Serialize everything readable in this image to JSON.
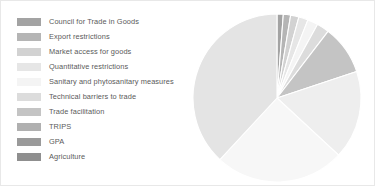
{
  "canvas": {
    "width": 375,
    "height": 186,
    "background": "#ffffff",
    "border_color": "#e8e8e8"
  },
  "legend": {
    "position": "left",
    "text_color": "#5a5a5a",
    "items": [
      {
        "label": "Council for Trade in Goods",
        "color": "#a3a3a3"
      },
      {
        "label": "Export restrictions",
        "color": "#b5b5b5"
      },
      {
        "label": "Market access for goods",
        "color": "#d2d2d2"
      },
      {
        "label": "Quantitative restrictions",
        "color": "#e6e6e6"
      },
      {
        "label": "Sanitary and phytosanitary measures",
        "color": "#f4f4f4"
      },
      {
        "label": "Technical barriers to trade",
        "color": "#dcdcdc"
      },
      {
        "label": "Trade facilitation",
        "color": "#c4c4c4"
      },
      {
        "label": "TRIPS",
        "color": "#b0b0b0"
      },
      {
        "label": "GPA",
        "color": "#9a9a9a"
      },
      {
        "label": "Agriculture",
        "color": "#8f8f8f"
      }
    ]
  },
  "chart_data": {
    "type": "pie",
    "title": "",
    "xlabel": "",
    "ylabel": "",
    "legend_position": "left",
    "grid": false,
    "start_angle_deg": 0,
    "direction": "clockwise",
    "center": {
      "cx": 86,
      "cy": 91
    },
    "radius": 84,
    "slice_separator_color": "#ffffff",
    "categories": [
      "Council for Trade in Goods",
      "Export restrictions",
      "Market access for goods",
      "Quantitative restrictions",
      "Sanitary and phytosanitary measures",
      "Technical barriers to trade",
      "Trade facilitation",
      "TRIPS",
      "GPA",
      "Agriculture"
    ],
    "values": [
      1.2,
      1.4,
      1.6,
      1.8,
      2.0,
      2.4,
      9.5,
      17.0,
      25.0,
      38.1
    ],
    "unit": "percent",
    "colors": [
      "#a3a3a3",
      "#b5b5b5",
      "#d2d2d2",
      "#e6e6e6",
      "#f4f4f4",
      "#dcdcdc",
      "#c4c4c4",
      "#eeeeee",
      "#f7f7f7",
      "#e4e4e4"
    ]
  }
}
